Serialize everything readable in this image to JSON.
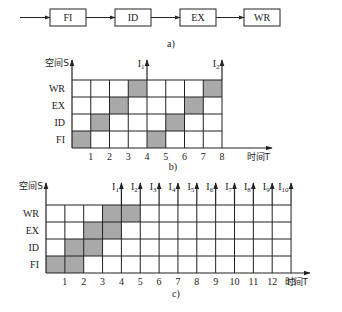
{
  "figure_a": {
    "caption": "a)",
    "stages": [
      "FI",
      "ID",
      "EX",
      "WR"
    ]
  },
  "figure_b": {
    "caption": "b)",
    "y_axis_label": "空间S",
    "x_axis_label": "时间T",
    "rows": [
      "FI",
      "ID",
      "EX",
      "WR"
    ],
    "columns": 8,
    "x_ticks": [
      "1",
      "2",
      "3",
      "4",
      "5",
      "6",
      "7",
      "8"
    ],
    "shaded": {
      "FI": [
        0,
        4
      ],
      "ID": [
        1,
        5
      ],
      "EX": [
        2,
        6
      ],
      "WR": [
        3,
        7
      ]
    },
    "instruction_markers": [
      {
        "label": "I",
        "sub": "1",
        "at": 4
      },
      {
        "label": "I",
        "sub": "2",
        "at": 8
      }
    ]
  },
  "figure_c": {
    "caption": "c)",
    "y_axis_label": "空间S",
    "x_axis_label": "时间T",
    "rows": [
      "FI",
      "ID",
      "EX",
      "WR"
    ],
    "columns": 13,
    "x_ticks": [
      "1",
      "2",
      "3",
      "4",
      "5",
      "6",
      "7",
      "8",
      "9",
      "10",
      "11",
      "12",
      "13"
    ],
    "shaded": {
      "FI": [
        0,
        1
      ],
      "ID": [
        1,
        2
      ],
      "EX": [
        2,
        3
      ],
      "WR": [
        3,
        4
      ]
    },
    "instruction_markers": [
      {
        "label": "I",
        "sub": "1",
        "at": 4
      },
      {
        "label": "I",
        "sub": "2",
        "at": 5
      },
      {
        "label": "I",
        "sub": "3",
        "at": 6
      },
      {
        "label": "I",
        "sub": "4",
        "at": 7
      },
      {
        "label": "I",
        "sub": "5",
        "at": 8
      },
      {
        "label": "I",
        "sub": "6",
        "at": 9
      },
      {
        "label": "I",
        "sub": "7",
        "at": 10
      },
      {
        "label": "I",
        "sub": "8",
        "at": 11
      },
      {
        "label": "I",
        "sub": "9",
        "at": 12
      },
      {
        "label": "I",
        "sub": "10",
        "at": 13
      }
    ]
  },
  "colors": {
    "line": "#222222",
    "shade": "#a9a9a9",
    "background": "#ffffff"
  }
}
